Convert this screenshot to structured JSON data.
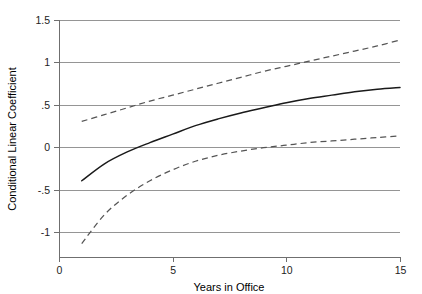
{
  "chart_data": {
    "type": "line",
    "title": "",
    "xlabel": "Years in Office",
    "ylabel": "Conditional Linear Coefficient",
    "xlim": [
      0,
      15
    ],
    "ylim": [
      -1.25,
      1.5
    ],
    "grid": true,
    "legend": "none",
    "xticks": [
      0,
      5,
      10,
      15
    ],
    "xticklabels": [
      "0",
      "5",
      "10",
      "15"
    ],
    "yticks": [
      1.5,
      1,
      0.5,
      0,
      -0.5,
      -1
    ],
    "yticklabels": [
      "1.5",
      "1",
      ".5",
      "0",
      "-.5",
      "-1"
    ],
    "x": [
      1,
      2,
      3,
      4,
      5,
      6,
      7,
      8,
      9,
      10,
      11,
      12,
      13,
      14,
      15
    ],
    "series": [
      {
        "name": "Conditional linear coefficient",
        "style": "solid",
        "color": "#1a1a1a",
        "values": [
          -0.39,
          -0.19,
          -0.05,
          0.06,
          0.16,
          0.26,
          0.34,
          0.41,
          0.47,
          0.53,
          0.58,
          0.62,
          0.66,
          0.69,
          0.71
        ]
      },
      {
        "name": "Upper 95% confidence bound",
        "style": "dashed",
        "color": "#555555",
        "values": [
          0.31,
          0.39,
          0.47,
          0.55,
          0.62,
          0.69,
          0.76,
          0.83,
          0.9,
          0.96,
          1.02,
          1.08,
          1.14,
          1.2,
          1.27
        ]
      },
      {
        "name": "Lower 95% confidence bound",
        "style": "dashed",
        "color": "#555555",
        "values": [
          -1.13,
          -0.79,
          -0.56,
          -0.39,
          -0.26,
          -0.16,
          -0.09,
          -0.04,
          0.0,
          0.03,
          0.06,
          0.08,
          0.1,
          0.12,
          0.14
        ]
      }
    ]
  },
  "axes": {
    "y_title": "Conditional Linear Coefficient",
    "x_title": "Years in Office",
    "y_tick_labels": [
      "1.5",
      "1",
      ".5",
      "0",
      "-.5",
      "-1"
    ],
    "x_tick_labels": [
      "0",
      "5",
      "10",
      "15"
    ]
  }
}
